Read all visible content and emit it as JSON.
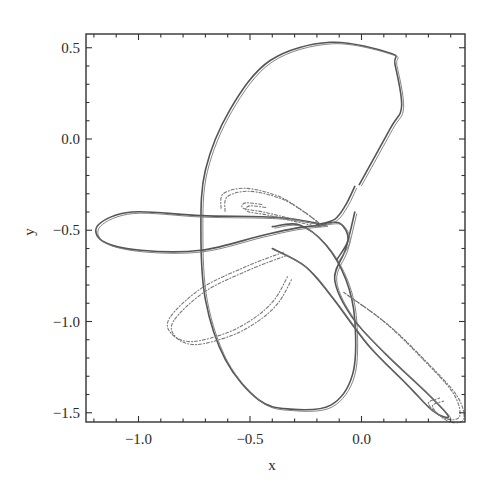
{
  "chart_data": {
    "type": "scatter",
    "title": "",
    "xlabel": "x",
    "ylabel": "y",
    "xlim": [
      -1.24,
      0.46
    ],
    "ylim": [
      -1.56,
      0.58
    ],
    "grid": false,
    "legend": null,
    "x_ticks": [
      -1.0,
      -0.5,
      0.0
    ],
    "x_tick_labels": [
      "−1.0",
      "−0.5",
      "0.0"
    ],
    "y_ticks": [
      0.5,
      0.0,
      -0.5,
      -1.0,
      -1.5
    ],
    "y_tick_labels": [
      "0.5",
      "0.0",
      "−0.5",
      "−1.0",
      "−1.5"
    ],
    "minor_tick_step": 0.1,
    "series": [
      {
        "name": "main-loop",
        "style": "solid",
        "points": [
          [
            -0.01,
            -0.25
          ],
          [
            0.13,
            0.06
          ],
          [
            0.18,
            0.18
          ],
          [
            0.15,
            0.41
          ],
          [
            0.13,
            0.47
          ],
          [
            -0.14,
            0.53
          ],
          [
            -0.41,
            0.43
          ],
          [
            -0.59,
            0.16
          ],
          [
            -0.7,
            -0.17
          ],
          [
            -0.72,
            -0.5
          ],
          [
            -0.7,
            -0.88
          ],
          [
            -0.61,
            -1.21
          ],
          [
            -0.46,
            -1.43
          ],
          [
            -0.32,
            -1.48
          ],
          [
            -0.14,
            -1.46
          ],
          [
            -0.04,
            -1.29
          ],
          [
            -0.03,
            -0.99
          ],
          [
            -0.07,
            -0.77
          ],
          [
            -0.16,
            -0.58
          ],
          [
            -0.28,
            -0.47
          ],
          [
            -0.4,
            -0.48
          ]
        ]
      },
      {
        "name": "left-lobe",
        "style": "solid",
        "points": [
          [
            -0.16,
            -0.47
          ],
          [
            -0.37,
            -0.43
          ],
          [
            -0.72,
            -0.42
          ],
          [
            -1.03,
            -0.4
          ],
          [
            -1.18,
            -0.47
          ],
          [
            -1.16,
            -0.56
          ],
          [
            -0.99,
            -0.61
          ],
          [
            -0.72,
            -0.61
          ],
          [
            -0.45,
            -0.53
          ],
          [
            -0.3,
            -0.49
          ],
          [
            -0.16,
            -0.47
          ]
        ]
      },
      {
        "name": "lower-right-lobe",
        "style": "solid",
        "points": [
          [
            -0.03,
            -0.4
          ],
          [
            -0.07,
            -0.6
          ],
          [
            -0.12,
            -0.77
          ],
          [
            -0.04,
            -0.98
          ],
          [
            0.11,
            -1.18
          ],
          [
            0.3,
            -1.4
          ],
          [
            0.39,
            -1.52
          ],
          [
            0.32,
            -1.49
          ],
          [
            0.2,
            -1.34
          ],
          [
            0.03,
            -1.13
          ],
          [
            -0.13,
            -0.87
          ],
          [
            -0.25,
            -0.7
          ],
          [
            -0.4,
            -0.6
          ]
        ]
      },
      {
        "name": "cusp-region",
        "style": "solid",
        "points": [
          [
            -0.03,
            -0.26
          ],
          [
            -0.07,
            -0.36
          ],
          [
            -0.12,
            -0.44
          ],
          [
            -0.2,
            -0.47
          ],
          [
            -0.1,
            -0.46
          ],
          [
            -0.06,
            -0.55
          ],
          [
            -0.11,
            -0.66
          ]
        ]
      },
      {
        "name": "upper-dotted-filament",
        "style": "dotted",
        "points": [
          [
            -0.63,
            -0.38
          ],
          [
            -0.62,
            -0.3
          ],
          [
            -0.52,
            -0.27
          ],
          [
            -0.38,
            -0.31
          ],
          [
            -0.28,
            -0.38
          ],
          [
            -0.2,
            -0.46
          ],
          [
            -0.3,
            -0.44
          ],
          [
            -0.44,
            -0.4
          ],
          [
            -0.53,
            -0.38
          ],
          [
            -0.52,
            -0.35
          ],
          [
            -0.44,
            -0.36
          ]
        ]
      },
      {
        "name": "lower-left-dotted-filament",
        "style": "dotted",
        "points": [
          [
            -0.35,
            -0.62
          ],
          [
            -0.52,
            -0.7
          ],
          [
            -0.72,
            -0.82
          ],
          [
            -0.86,
            -0.98
          ],
          [
            -0.85,
            -1.07
          ],
          [
            -0.76,
            -1.11
          ],
          [
            -0.6,
            -1.06
          ],
          [
            -0.48,
            -0.98
          ],
          [
            -0.39,
            -0.88
          ],
          [
            -0.33,
            -0.75
          ]
        ]
      },
      {
        "name": "lower-right-dotted-filament",
        "style": "dotted",
        "points": [
          [
            -0.08,
            -0.84
          ],
          [
            0.1,
            -1.0
          ],
          [
            0.27,
            -1.2
          ],
          [
            0.41,
            -1.39
          ],
          [
            0.44,
            -1.52
          ],
          [
            0.37,
            -1.53
          ],
          [
            0.3,
            -1.45
          ],
          [
            0.35,
            -1.42
          ]
        ]
      }
    ]
  }
}
